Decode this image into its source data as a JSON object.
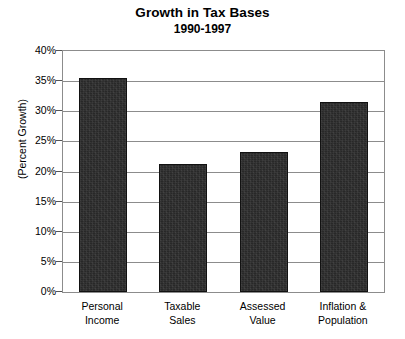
{
  "chart_data": {
    "type": "bar",
    "title": "Growth in Tax Bases",
    "subtitle": "1990-1997",
    "xlabel": "",
    "ylabel": "(Percent Growth)",
    "ylim": [
      0,
      40
    ],
    "ytick_values": [
      0,
      5,
      10,
      15,
      20,
      25,
      30,
      35,
      40
    ],
    "ytick_labels": [
      "0%",
      "5%",
      "10%",
      "15%",
      "20%",
      "25%",
      "30%",
      "35%",
      "40%"
    ],
    "grid": true,
    "legend": null,
    "bar_color": "#282828",
    "categories": [
      "Personal\nIncome",
      "Taxable\nSales",
      "Assessed\nValue",
      "Inflation &\nPopulation"
    ],
    "values": [
      35.5,
      21.3,
      23.3,
      31.5
    ]
  }
}
